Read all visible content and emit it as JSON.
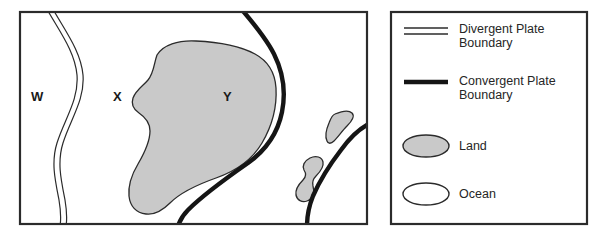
{
  "figure": {
    "type": "plate-tectonics-map-with-legend",
    "background_color": "#ffffff",
    "outline_color": "#2b2b2b",
    "land_fill_color": "#c9c9c9",
    "ocean_fill_color": "#ffffff"
  },
  "map": {
    "name": "tectonic-plate-map",
    "frame": {
      "x": 19,
      "y": 11,
      "width": 349,
      "height": 214
    },
    "region_labels": [
      {
        "id": "W",
        "text": "W",
        "x": 31,
        "y": 90
      },
      {
        "id": "X",
        "text": "X",
        "x": 113,
        "y": 90
      },
      {
        "id": "Y",
        "text": "Y",
        "x": 223,
        "y": 90
      }
    ],
    "features": [
      {
        "name": "divergent-plate-boundary-line",
        "style": "double-thin-line"
      },
      {
        "name": "convergent-plate-boundary-line-main",
        "style": "thick-solid-line"
      },
      {
        "name": "convergent-plate-boundary-line-right",
        "style": "thick-solid-line"
      },
      {
        "name": "land-mass-y",
        "style": "gray-filled-polygon"
      },
      {
        "name": "island-upper-right",
        "style": "gray-filled-polygon"
      },
      {
        "name": "island-lower-right",
        "style": "gray-filled-polygon"
      }
    ]
  },
  "legend": {
    "name": "map-legend",
    "frame": {
      "x": 390,
      "y": 11,
      "width": 198,
      "height": 214
    },
    "items": [
      {
        "symbol": "divergent-plate-boundary-symbol",
        "symbol_type": "double-line",
        "label": "Divergent Plate\nBoundary"
      },
      {
        "symbol": "convergent-plate-boundary-symbol",
        "symbol_type": "thick-line",
        "label": "Convergent Plate\nBoundary"
      },
      {
        "symbol": "land-symbol",
        "symbol_type": "filled-ellipse",
        "label": "Land"
      },
      {
        "symbol": "ocean-symbol",
        "symbol_type": "open-ellipse",
        "label": "Ocean"
      }
    ]
  }
}
